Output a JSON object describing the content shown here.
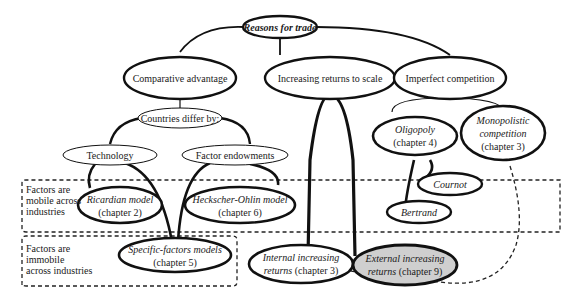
{
  "diagram": {
    "root": {
      "label": "Reasons for trade"
    },
    "level1": [
      {
        "id": "comparative",
        "label": "Comparative advantage"
      },
      {
        "id": "irs",
        "label": "Increasing returns to scale"
      },
      {
        "id": "imperfect",
        "label": "Imperfect competition"
      }
    ],
    "countries_differ": {
      "label": "Countries differ by:"
    },
    "technology": {
      "label": "Technology"
    },
    "factor_endowments": {
      "label": "Factor endowments"
    },
    "ricardian": {
      "line1": "Ricardian model",
      "line2": "(chapter 2)"
    },
    "hecksher": {
      "line1": "Heckscher-Ohlin model",
      "line2": "(chapter 6)"
    },
    "specific": {
      "line1": "Specific-factors models",
      "line2": "(chapter 5)"
    },
    "internal": {
      "line1": "Internal increasing",
      "line2a": "returns",
      "line2b": " (chapter 3)"
    },
    "external": {
      "line1": "External increasing",
      "line2a": "returns",
      "line2b": " (chapter 9)",
      "fill": "#cfcfcf"
    },
    "oligopoly": {
      "line1": "Oligopoly",
      "line2": "(chapter 4)"
    },
    "monopolistic": {
      "line1": "Monopolistic",
      "line2": "competition",
      "line3": "(chapter 3)"
    },
    "cournot": {
      "label": "Cournot"
    },
    "bertrand": {
      "label": "Bertrand"
    },
    "box_mobile": {
      "line1": "Factors are",
      "line2": "mobile across",
      "line3": "industries"
    },
    "box_immobile": {
      "line1": "Factors are",
      "line2": "immobile",
      "line3": "across industries"
    }
  }
}
